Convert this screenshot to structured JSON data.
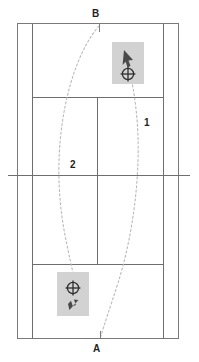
{
  "diagram": {
    "type": "overhead-court-schematic",
    "colors": {
      "background": "#ffffff",
      "court_line": "#6e6e6e",
      "trajectory": "#b9b9b9",
      "marker_box": "#d2d2d2",
      "marker_glyph": "#4a4a4a",
      "label_text": "#1f1f1f"
    },
    "labels": {
      "top_endpoint": "B",
      "bottom_endpoint": "A",
      "trajectory_one": "1",
      "trajectory_two": "2"
    },
    "markers": [
      {
        "id": "top-marker",
        "name": "upper-player-marker",
        "glyph": "arrow-up-right-icon",
        "crosshair": "crosshair-target-icon",
        "x": 112,
        "y": 42,
        "width": 32,
        "height": 42,
        "glyph_position": "above-crosshair"
      },
      {
        "id": "bottom-marker",
        "name": "lower-player-marker",
        "glyph": "arrow-down-left-icon",
        "crosshair": "crosshair-target-icon",
        "x": 57,
        "y": 272,
        "width": 32,
        "height": 44,
        "glyph_position": "below-crosshair"
      }
    ],
    "court": {
      "outer": {
        "x": 17,
        "y": 23,
        "width": 161,
        "height": 316
      },
      "singles_left_x": 32,
      "singles_right_x": 163,
      "service_line_top_y": 97,
      "service_line_bottom_y": 264,
      "net_y": 175,
      "net_left_x": 8,
      "net_right_x": 190,
      "center_service_line_x": 97
    },
    "trajectories": [
      {
        "id": "traj-1",
        "label": "1",
        "from": "top-marker",
        "to": "A",
        "style": "dashed-curve"
      },
      {
        "id": "traj-2",
        "label": "2",
        "from": "B",
        "to": "bottom-marker",
        "style": "dashed-curve"
      }
    ]
  }
}
